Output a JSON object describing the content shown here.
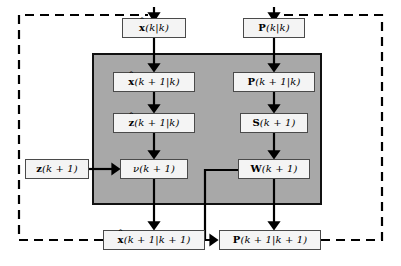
{
  "diagram": {
    "panel_label": "prediction-and-update-stage",
    "colors": {
      "panel_fill": "#a8a8a8",
      "node_fill": "#f4f4f4",
      "line": "#000000",
      "background": "#ffffff"
    }
  },
  "nodes": {
    "x_hat_k_k": {
      "id": "x-hat-k-given-k",
      "label": "x̂(k|k)",
      "symbol": "x",
      "hat": true,
      "args": "(k|k)",
      "x": 122,
      "y": 18,
      "w": 64,
      "h": 20
    },
    "p_k_k": {
      "id": "p-k-given-k",
      "label": "P(k|k)",
      "symbol": "P",
      "hat": false,
      "args": "(k|k)",
      "x": 243,
      "y": 18,
      "w": 62,
      "h": 20
    },
    "x_hat_k1_k": {
      "id": "x-hat-k-plus-1-given-k",
      "label": "x̂(k + 1|k)",
      "symbol": "x",
      "hat": true,
      "args": "(k + 1|k)",
      "x": 113,
      "y": 72,
      "w": 82,
      "h": 20
    },
    "p_k1_k": {
      "id": "p-k-plus-1-given-k",
      "label": "P(k + 1|k)",
      "symbol": "P",
      "hat": false,
      "args": "(k + 1|k)",
      "x": 233,
      "y": 72,
      "w": 82,
      "h": 20
    },
    "z_hat_k1_k": {
      "id": "z-hat-k-plus-1-given-k",
      "label": "ẑ(k + 1|k)",
      "symbol": "z",
      "hat": true,
      "args": "(k + 1|k)",
      "x": 113,
      "y": 113,
      "w": 82,
      "h": 20
    },
    "s_k1": {
      "id": "s-k-plus-1",
      "label": "S(k + 1)",
      "symbol": "S",
      "hat": false,
      "args": "(k + 1)",
      "x": 240,
      "y": 113,
      "w": 68,
      "h": 20
    },
    "nu_k1": {
      "id": "nu-innovation-k-plus-1",
      "label": "ν(k + 1)",
      "symbol": "ν",
      "hat": false,
      "args": "(k + 1)",
      "x": 120,
      "y": 159,
      "w": 68,
      "h": 20
    },
    "w_k1": {
      "id": "w-gain-k-plus-1",
      "label": "W(k + 1)",
      "symbol": "W",
      "hat": false,
      "args": "(k + 1)",
      "x": 238,
      "y": 159,
      "w": 72,
      "h": 20
    },
    "z_k1": {
      "id": "z-measurement-k-plus-1",
      "label": "z(k + 1)",
      "symbol": "z",
      "hat": false,
      "args": "(k + 1)",
      "x": 25,
      "y": 159,
      "w": 64,
      "h": 20
    },
    "x_hat_k1_k1": {
      "id": "x-hat-k-plus-1-given-k-plus-1",
      "label": "x̂(k + 1|k + 1)",
      "symbol": "x",
      "hat": true,
      "args": "(k + 1|k + 1)",
      "x": 103,
      "y": 230,
      "w": 102,
      "h": 20
    },
    "p_k1_k1": {
      "id": "p-k-plus-1-given-k-plus-1",
      "label": "P(k + 1|k + 1)",
      "symbol": "P",
      "hat": false,
      "args": "(k + 1|k + 1)",
      "x": 219,
      "y": 230,
      "w": 102,
      "h": 20
    }
  },
  "connections": [
    {
      "name": "x-hat-kk-to-x-hat-k1k",
      "style": "solid",
      "from": "x_hat_k_k",
      "to": "x_hat_k1_k"
    },
    {
      "name": "x-hat-k1k-to-z-hat-k1k",
      "style": "solid",
      "from": "x_hat_k1_k",
      "to": "z_hat_k1_k"
    },
    {
      "name": "z-hat-k1k-to-nu",
      "style": "solid",
      "from": "z_hat_k1_k",
      "to": "nu_k1"
    },
    {
      "name": "z-measurement-to-nu",
      "style": "solid",
      "from": "z_k1",
      "to": "nu_k1"
    },
    {
      "name": "nu-to-x-hat-k1k1",
      "style": "solid",
      "from": "nu_k1",
      "to": "x_hat_k1_k1"
    },
    {
      "name": "p-kk-to-p-k1k",
      "style": "solid",
      "from": "p_k_k",
      "to": "p_k1_k"
    },
    {
      "name": "p-k1k-to-s",
      "style": "solid",
      "from": "p_k1_k",
      "to": "s_k1"
    },
    {
      "name": "s-to-w",
      "style": "solid",
      "from": "s_k1",
      "to": "w_k1"
    },
    {
      "name": "w-to-p-k1k1",
      "style": "solid",
      "from": "w_k1",
      "to": "p_k1_k1"
    },
    {
      "name": "w-to-x-hat-k1k1",
      "style": "solid",
      "from": "w_k1",
      "to": "x_hat_k1_k1"
    },
    {
      "name": "feedback-x-hat-left-loop",
      "style": "dashed",
      "from": "x_hat_k1_k1",
      "to": "x_hat_k_k"
    },
    {
      "name": "feedback-p-right-loop",
      "style": "dashed",
      "from": "p_k1_k1",
      "to": "p_k_k"
    }
  ]
}
